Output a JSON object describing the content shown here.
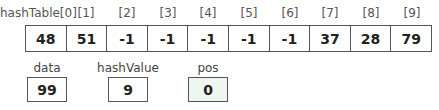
{
  "array": {
    "name": "hashTable",
    "index_labels": [
      "hashTable[0]",
      "[1]",
      "[2]",
      "[3]",
      "[4]",
      "[5]",
      "[6]",
      "[7]",
      "[8]",
      "[9]"
    ],
    "values": [
      "48",
      "51",
      "-1",
      "-1",
      "-1",
      "-1",
      "-1",
      "37",
      "28",
      "79"
    ]
  },
  "variables": [
    {
      "label": "data",
      "value": "99",
      "highlighted": false
    },
    {
      "label": "hashValue",
      "value": "9",
      "highlighted": false
    },
    {
      "label": "pos",
      "value": "0",
      "highlighted": true,
      "fill": "#eef6f0"
    }
  ],
  "colors": {
    "border": "#555555",
    "highlight": "#eef6f0"
  }
}
